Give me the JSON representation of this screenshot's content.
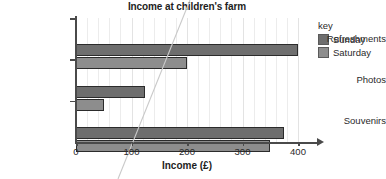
{
  "chart_data": {
    "type": "bar",
    "orientation": "horizontal",
    "title": "Income at children's farm",
    "xlabel": "Income (£)",
    "ylabel": "",
    "categories": [
      "Refreshments",
      "Photos",
      "Souvenirs"
    ],
    "series": [
      {
        "name": "Sunday",
        "values": [
          400,
          125,
          375
        ],
        "color": "#6e6e6e"
      },
      {
        "name": "Saturday",
        "values": [
          200,
          50,
          350
        ],
        "color": "#8d8d8d"
      }
    ],
    "xlim": [
      0,
      400
    ],
    "xticks": [
      0,
      100,
      200,
      300,
      400
    ],
    "xtick_labels": [
      "0",
      "100",
      "200",
      "300",
      "400"
    ],
    "minor_gridline_step": 20,
    "grid": true,
    "legend_position": "right",
    "legend_title": "key"
  },
  "legend": {
    "title": "key",
    "entries": [
      {
        "label": "Sunday"
      },
      {
        "label": "Saturday"
      }
    ]
  },
  "axis": {
    "x_title": "Income (£)"
  }
}
